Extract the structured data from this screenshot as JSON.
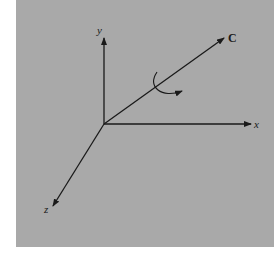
{
  "diagram": {
    "type": "3d-coordinate-axes",
    "background_color": "#a9a9a9",
    "line_color": "#1a1a1a",
    "axes": [
      {
        "name": "x",
        "label": "x"
      },
      {
        "name": "y",
        "label": "y"
      },
      {
        "name": "z",
        "label": "z"
      }
    ],
    "vector": {
      "label": "C"
    },
    "rotation_indicator": "curved-arrow-around-C"
  },
  "labels": {
    "x": "x",
    "y": "y",
    "z": "z",
    "c": "C"
  }
}
